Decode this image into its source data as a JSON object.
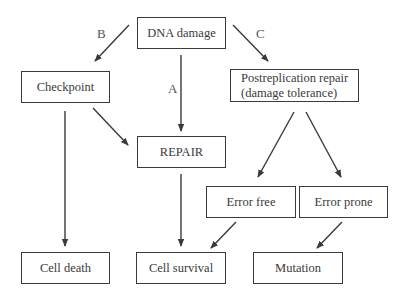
{
  "diagram": {
    "nodes": {
      "dna_damage": "DNA damage",
      "checkpoint": "Checkpoint",
      "postreplication_line1": "Postreplication repair",
      "postreplication_line2": "(damage tolerance)",
      "repair": "REPAIR",
      "error_free": "Error free",
      "error_prone": "Error prone",
      "cell_death": "Cell death",
      "cell_survival": "Cell survival",
      "mutation": "Mutation"
    },
    "edge_labels": {
      "a": "A",
      "b": "B",
      "c": "C"
    },
    "edges": [
      {
        "from": "DNA damage",
        "to": "Checkpoint",
        "label": "B"
      },
      {
        "from": "DNA damage",
        "to": "REPAIR",
        "label": "A"
      },
      {
        "from": "DNA damage",
        "to": "Postreplication repair (damage tolerance)",
        "label": "C"
      },
      {
        "from": "Checkpoint",
        "to": "REPAIR"
      },
      {
        "from": "Checkpoint",
        "to": "Cell death"
      },
      {
        "from": "Postreplication repair (damage tolerance)",
        "to": "Error free"
      },
      {
        "from": "Postreplication repair (damage tolerance)",
        "to": "Error prone"
      },
      {
        "from": "REPAIR",
        "to": "Cell survival"
      },
      {
        "from": "Error free",
        "to": "Cell survival"
      },
      {
        "from": "Error prone",
        "to": "Mutation"
      }
    ],
    "colors": {
      "line": "#3a3a3a",
      "text": "#3a3a3a",
      "background": "#ffffff"
    }
  }
}
